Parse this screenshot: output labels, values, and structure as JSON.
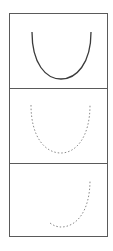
{
  "figure": {
    "layout": "vertical stack of 3 framed panels",
    "frame_color": "#5a5a5a",
    "panels": [
      {
        "id": "panel-1",
        "curve": "U-shaped parabola",
        "style": "solid",
        "stroke": "#3a3a3a",
        "path": "M22 18 C22 50, 36 65, 51 65 C66 65, 81 50, 81 18"
      },
      {
        "id": "panel-2",
        "curve": "U-shaped parabola",
        "style": "dotted",
        "stroke": "#8a8a8a",
        "path": "M21 16 C21 48, 35 64, 51 64 C66 64, 80 48, 80 16"
      },
      {
        "id": "panel-3",
        "curve": "partial parabola (right half)",
        "style": "dotted",
        "stroke": "#8a8a8a",
        "path": "M40 59 C44 62, 48 63, 51 63 C66 63, 80 48, 80 16"
      }
    ]
  }
}
